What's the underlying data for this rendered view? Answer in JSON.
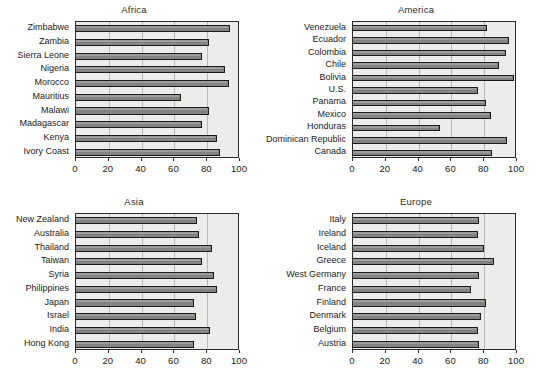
{
  "figure": {
    "background": "#ffffff",
    "plot_background": "#ececeb",
    "bar_color": "#838383",
    "bar_edge_color": "#1c1c1c",
    "gridline_color": "#b9b9b7"
  },
  "axis": {
    "ticks": [
      0,
      20,
      40,
      60,
      80,
      100
    ],
    "tick_labels": [
      "0",
      "20",
      "40",
      "60",
      "80",
      "100"
    ],
    "xlim": [
      0,
      100
    ]
  },
  "caption_partial": "",
  "chart_data": [
    {
      "type": "bar",
      "orientation": "horizontal",
      "title": "Africa",
      "xlabel": "",
      "ylabel": "",
      "xlim": [
        0,
        100
      ],
      "grid": true,
      "legend": "none",
      "categories": [
        "Zimbabwe",
        "Zambia",
        "Sierra Leone",
        "Nigeria",
        "Morocco",
        "Mauritius",
        "Malawi",
        "Madagascar",
        "Kenya",
        "Ivory Coast"
      ],
      "values": [
        94,
        81,
        77,
        91,
        93,
        64,
        81,
        77,
        86,
        88
      ]
    },
    {
      "type": "bar",
      "orientation": "horizontal",
      "title": "America",
      "xlabel": "",
      "ylabel": "",
      "xlim": [
        0,
        100
      ],
      "grid": true,
      "legend": "none",
      "categories": [
        "Venezuela",
        "Ecuador",
        "Colombia",
        "Chile",
        "Bolivia",
        "U.S.",
        "Panama",
        "Mexico",
        "Honduras",
        "Dominican Republic",
        "Canada"
      ],
      "values": [
        82,
        95,
        93,
        89,
        98,
        76,
        81,
        84,
        53,
        94,
        85
      ]
    },
    {
      "type": "bar",
      "orientation": "horizontal",
      "title": "Asia",
      "xlabel": "",
      "ylabel": "",
      "xlim": [
        0,
        100
      ],
      "grid": true,
      "legend": "none",
      "categories": [
        "New Zealand",
        "Australia",
        "Thailand",
        "Taiwan",
        "Syria",
        "Philippines",
        "Japan",
        "Israel",
        "India",
        "Hong Kong"
      ],
      "values": [
        74,
        75,
        83,
        77,
        84,
        86,
        72,
        73,
        82,
        72
      ]
    },
    {
      "type": "bar",
      "orientation": "horizontal",
      "title": "Europe",
      "xlabel": "",
      "ylabel": "",
      "xlim": [
        0,
        100
      ],
      "grid": true,
      "legend": "none",
      "categories": [
        "Italy",
        "Ireland",
        "Iceland",
        "Greece",
        "West Germany",
        "France",
        "Finland",
        "Denmark",
        "Belgium",
        "Austria"
      ],
      "values": [
        77,
        76,
        80,
        86,
        77,
        72,
        81,
        78,
        76,
        77
      ]
    }
  ]
}
